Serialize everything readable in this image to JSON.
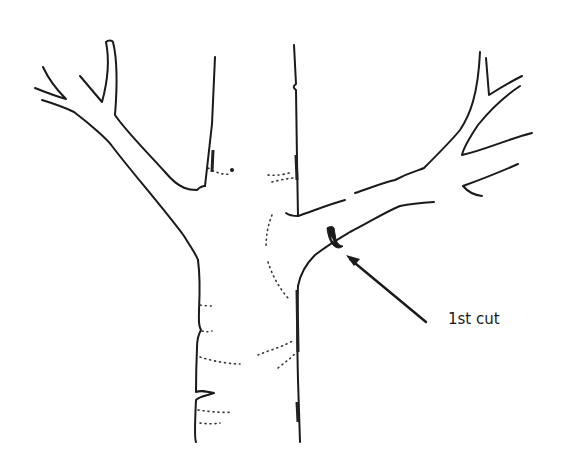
{
  "figure": {
    "annotation": {
      "label": "1st cut",
      "arrow_from": [
        380,
        315
      ],
      "arrow_to": [
        345,
        256
      ]
    },
    "colors": {
      "line": "#1a1a1a",
      "background": "#ffffff"
    }
  }
}
